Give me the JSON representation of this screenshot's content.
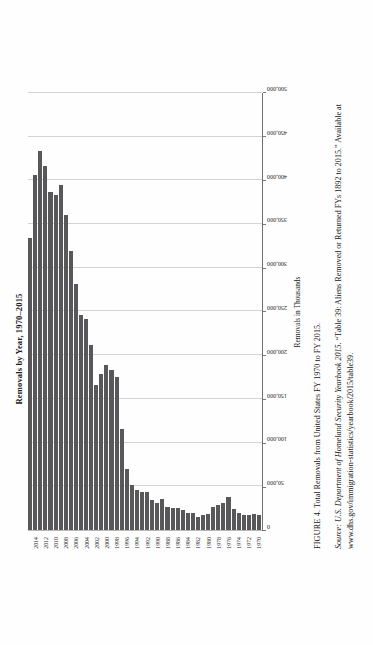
{
  "figure": {
    "kicker": "FIGURE 4.",
    "caption": "Total Removals from United States FY 1970 to FY 2015.",
    "source_kicker": "Source:",
    "source_italic": "U.S. Department of Homeland Security Yearbook 2015.",
    "source_rest": "“Table 39: Aliens Removed or Returned FYs 1892 to 2015.” Available at www.dhs.gov/immigration-statistics/yearbook/2015/table39."
  },
  "chart_data": {
    "type": "bar",
    "orientation": "horizontal",
    "title": "Removals by Year, 1970–2015",
    "xlabel": "Removals in Thousands",
    "ylabel": "",
    "xlim": [
      0,
      500000
    ],
    "grid": true,
    "legend": "none",
    "bar_color": "#58585a",
    "xticks": [
      "0",
      "50,000",
      "100,000",
      "150,000",
      "200,000",
      "250,000",
      "300,000",
      "350,000",
      "400,000",
      "450,000",
      "500,000"
    ],
    "ytick_labels": [
      "1970",
      "1972",
      "1974",
      "1976",
      "1978",
      "1980",
      "1982",
      "1984",
      "1986",
      "1988",
      "1990",
      "1992",
      "1994",
      "1996",
      "1998",
      "2000",
      "2002",
      "2004",
      "2006",
      "2008",
      "2010",
      "2012",
      "2014"
    ],
    "categories": [
      "1970",
      "1971",
      "1972",
      "1973",
      "1974",
      "1975",
      "1976",
      "1977",
      "1978",
      "1979",
      "1980",
      "1981",
      "1982",
      "1983",
      "1984",
      "1985",
      "1986",
      "1987",
      "1988",
      "1989",
      "1990",
      "1991",
      "1992",
      "1993",
      "1994",
      "1995",
      "1996",
      "1997",
      "1998",
      "1999",
      "2000",
      "2001",
      "2002",
      "2003",
      "2004",
      "2005",
      "2006",
      "2007",
      "2008",
      "2009",
      "2010",
      "2011",
      "2012",
      "2013",
      "2014",
      "2015"
    ],
    "values": [
      17000,
      18000,
      17000,
      17000,
      19000,
      24000,
      38000,
      31000,
      29000,
      26000,
      18000,
      17000,
      15000,
      20000,
      19000,
      23000,
      25000,
      25000,
      26000,
      35000,
      31000,
      34000,
      44000,
      43000,
      46000,
      51000,
      70000,
      115000,
      175000,
      183000,
      189000,
      178000,
      166000,
      212000,
      241000,
      246000,
      281000,
      319000,
      360000,
      395000,
      383000,
      387000,
      416000,
      434000,
      406000,
      334000
    ]
  }
}
